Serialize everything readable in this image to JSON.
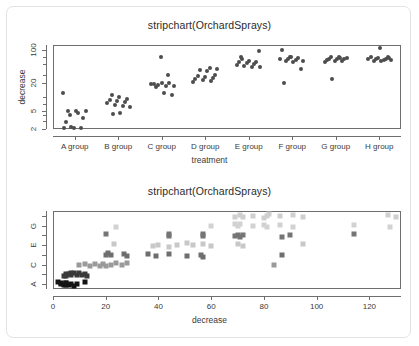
{
  "card": {
    "background": "#ffffff",
    "border_color": "#e3e3e3"
  },
  "panels": [
    {
      "id": "top",
      "title": "stripchart(OrchardSprays)",
      "xlabel": "treatment",
      "ylabel": "decrease"
    },
    {
      "id": "bottom",
      "title": "stripchart(OrchardSprays)",
      "xlabel": "decrease",
      "ylabel": ""
    }
  ],
  "chart_data": [
    {
      "type": "scatter",
      "title": "stripchart(OrchardSprays)",
      "xlabel": "treatment",
      "ylabel": "decrease",
      "yscale": "log",
      "ylim": [
        2,
        130
      ],
      "ytick_labels": [
        "100",
        "20",
        "5",
        "2"
      ],
      "ytick_values": [
        100,
        20,
        5,
        2
      ],
      "xtick_labels": [
        "A group",
        "B group",
        "C group",
        "D group",
        "E group",
        "F group",
        "G group",
        "H group"
      ],
      "grid": false,
      "legend": "none",
      "marker": "filled-circle",
      "marker_color": "#4d4d4d",
      "series": [
        {
          "name": "A group",
          "values": [
            12,
            4,
            4.5,
            5,
            5,
            5,
            3.5,
            2.9,
            2.1,
            2.1,
            2.1,
            2.2
          ]
        },
        {
          "name": "B group",
          "values": [
            11,
            10,
            9,
            8.5,
            8,
            7.5,
            7.2,
            6.5,
            6.2,
            6,
            4.2,
            4.5
          ]
        },
        {
          "name": "C group",
          "values": [
            72,
            29,
            19,
            18,
            17,
            17,
            16.5,
            12,
            11,
            19,
            20,
            20
          ]
        },
        {
          "name": "D group",
          "values": [
            41,
            40,
            38,
            36,
            30,
            28,
            26,
            25,
            24,
            23,
            22,
            21
          ]
        },
        {
          "name": "E group",
          "values": [
            95,
            70,
            60,
            57,
            55,
            52,
            50,
            48,
            45,
            44,
            43,
            65
          ]
        },
        {
          "name": "F group",
          "values": [
            100,
            72,
            68,
            66,
            64,
            62,
            60,
            58,
            56,
            40,
            20,
            70
          ]
        },
        {
          "name": "G group",
          "values": [
            72,
            70,
            68,
            66,
            65,
            64,
            62,
            60,
            58,
            56,
            24,
            67
          ]
        },
        {
          "name": "H group",
          "values": [
            110,
            72,
            70,
            68,
            66,
            65,
            64,
            63,
            62,
            60,
            58,
            69
          ]
        }
      ]
    },
    {
      "type": "scatter",
      "title": "stripchart(OrchardSprays)",
      "xlabel": "decrease",
      "ylabel": "",
      "xlim": [
        0,
        132
      ],
      "xtick_labels": [
        "0",
        "20",
        "40",
        "60",
        "80",
        "100",
        "120"
      ],
      "xtick_values": [
        0,
        20,
        40,
        60,
        80,
        100,
        120
      ],
      "ytick_labels": [
        "A",
        "C",
        "E",
        "G"
      ],
      "ytick_rows": [
        "A",
        "B",
        "C",
        "D",
        "E",
        "F",
        "G",
        "H"
      ],
      "grid": false,
      "legend": "none",
      "marker": "filled-square",
      "row_colors": {
        "A": "#141414",
        "B": "#3a3a3a",
        "C": "#9a9a9a",
        "D": "#6e6e6e",
        "E": "#c8c8c8",
        "F": "#757575",
        "G": "#d2d2d2",
        "H": "#cfcfcf"
      },
      "series": [
        {
          "name": "A",
          "values": [
            2,
            3,
            3,
            4,
            5,
            5,
            5,
            6,
            7,
            8,
            9,
            12
          ]
        },
        {
          "name": "B",
          "values": [
            4,
            5,
            5,
            6,
            7,
            7,
            8,
            9,
            10,
            11,
            12,
            13
          ]
        },
        {
          "name": "C",
          "values": [
            10,
            12,
            14,
            16,
            18,
            19,
            20,
            22,
            24,
            26,
            28,
            84
          ]
        },
        {
          "name": "D",
          "values": [
            20,
            21,
            22,
            27,
            28,
            36,
            39,
            44,
            51,
            56,
            57,
            87
          ]
        },
        {
          "name": "E",
          "values": [
            23,
            38,
            40,
            44,
            47,
            51,
            53,
            57,
            60,
            70,
            72,
            95
          ]
        },
        {
          "name": "F",
          "values": [
            20,
            44,
            57,
            69,
            70,
            71,
            72,
            87,
            90,
            114,
            57,
            44
          ]
        },
        {
          "name": "G",
          "values": [
            24,
            60,
            69,
            70,
            71,
            76,
            80,
            81,
            86,
            91,
            114,
            128
          ]
        },
        {
          "name": "H",
          "values": [
            69,
            71,
            72,
            76,
            80,
            81,
            82,
            86,
            91,
            95,
            127,
            130
          ]
        }
      ]
    }
  ]
}
